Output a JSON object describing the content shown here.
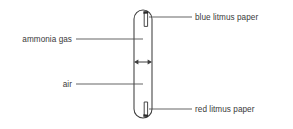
{
  "diagram": {
    "type": "science-apparatus-schematic",
    "colors": {
      "stroke": "#3f3f3f",
      "label_text": "#3a3a3a",
      "leader_line": "#4a4a4a",
      "paper_fill": "#ffffff",
      "attachment_mark": "#2b2b2b",
      "background": "#ffffff"
    },
    "apparatus": {
      "name": "glass tube",
      "shape": "vertical tube with rounded (hemispherical) ends",
      "left_x": 134,
      "right_x": 152,
      "top_y": 10,
      "bottom_y": 118,
      "corner_radius": 9
    },
    "marker": {
      "name": "diffusion-front-arrow",
      "style": "double-headed horizontal arrow",
      "y": 62,
      "x_start": 134,
      "x_end": 152
    },
    "papers": [
      {
        "id": "blue-litmus",
        "label": "blue litmus paper",
        "position": "top inside tube",
        "x": 145.5,
        "y_top": 13,
        "y_bottom": 27,
        "width": 5
      },
      {
        "id": "red-litmus",
        "label": "red litmus paper",
        "position": "bottom inside tube",
        "x": 145.5,
        "y_top": 101,
        "y_bottom": 115,
        "width": 5
      }
    ],
    "labels": [
      {
        "id": "ammonia-gas",
        "text": "ammonia gas",
        "side": "left",
        "points_to": "upper region inside tube",
        "leader": {
          "x1": 76,
          "y1": 39,
          "x2": 143,
          "y2": 39
        }
      },
      {
        "id": "air",
        "text": "air",
        "side": "left",
        "points_to": "lower region inside tube",
        "leader": {
          "x1": 76,
          "y1": 84,
          "x2": 143,
          "y2": 84
        }
      },
      {
        "id": "blue-litmus-paper",
        "text": "blue litmus paper",
        "side": "right",
        "points_to": "blue litmus paper at top of tube",
        "leader": {
          "x1": 149,
          "y1": 17,
          "x2": 192,
          "y2": 17
        }
      },
      {
        "id": "red-litmus-paper",
        "text": "red litmus paper",
        "side": "right",
        "points_to": "red litmus paper at bottom of tube",
        "leader": {
          "x1": 149,
          "y1": 109,
          "x2": 192,
          "y2": 109
        }
      }
    ]
  }
}
